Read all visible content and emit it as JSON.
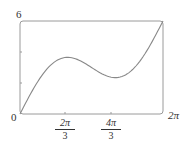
{
  "chart_data": {
    "type": "line",
    "title": "",
    "function": "y = x + 2 sin x",
    "xlabel": "",
    "ylabel": "",
    "xlim": [
      0,
      6.2832
    ],
    "ylim": [
      0,
      6
    ],
    "x_ticks": [
      {
        "value": 2.0944,
        "num": "2π",
        "den": "3"
      },
      {
        "value": 4.1888,
        "num": "4π",
        "den": "3"
      }
    ],
    "x_labels": {
      "origin": "0",
      "end": "2π"
    },
    "y_labels": {
      "top": "6"
    },
    "y_ticks": [
      2,
      4
    ],
    "grid": false,
    "legend": null,
    "series": [
      {
        "name": "y = x + 2 sin x",
        "x": [
          0,
          0.5236,
          1.0472,
          1.5708,
          2.0944,
          2.618,
          3.1416,
          3.6652,
          4.1888,
          4.7124,
          5.236,
          5.7596,
          6.2832
        ],
        "y": [
          0,
          1.52,
          2.78,
          3.57,
          3.83,
          3.62,
          3.14,
          2.67,
          2.46,
          2.71,
          3.5,
          4.76,
          6.28
        ]
      }
    ],
    "color": "#888888"
  }
}
